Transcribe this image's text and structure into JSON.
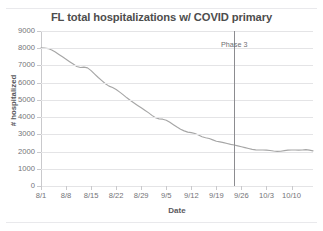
{
  "chart_data": {
    "type": "line",
    "title": "FL total hospitalizations w/ COVID primary",
    "xlabel": "Date",
    "ylabel": "# hospitalized",
    "ylim": [
      0,
      9000
    ],
    "ytick_labels": [
      "9000",
      "8000",
      "7000",
      "6000",
      "5000",
      "4000",
      "3000",
      "2000",
      "1000",
      "0"
    ],
    "ytick_values": [
      9000,
      8000,
      7000,
      6000,
      5000,
      4000,
      3000,
      2000,
      1000,
      0
    ],
    "xtick_labels": [
      "8/1",
      "8/8",
      "8/15",
      "8/22",
      "8/29",
      "9/5",
      "9/12",
      "9/19",
      "9/26",
      "10/3",
      "10/10"
    ],
    "xtick_day_index": [
      0,
      7,
      14,
      21,
      28,
      35,
      42,
      49,
      56,
      63,
      70
    ],
    "x_day_range": [
      0,
      76
    ],
    "grid": "horizontal",
    "legend": "none",
    "series": [
      {
        "name": "FL total hospitalizations w/ COVID primary",
        "color": "#a6a6a6",
        "x": [
          0,
          1,
          2,
          3,
          4,
          5,
          6,
          7,
          8,
          9,
          10,
          11,
          12,
          13,
          14,
          15,
          16,
          17,
          18,
          19,
          20,
          21,
          22,
          23,
          24,
          25,
          26,
          27,
          28,
          29,
          30,
          31,
          32,
          33,
          34,
          35,
          36,
          37,
          38,
          39,
          40,
          41,
          42,
          43,
          44,
          45,
          46,
          47,
          48,
          49,
          50,
          51,
          52,
          53,
          54,
          55,
          56,
          57,
          58,
          59,
          60,
          61,
          62,
          63,
          64,
          65,
          66,
          67,
          68,
          69,
          70,
          71,
          72,
          73,
          74,
          75,
          76
        ],
        "values": [
          8020,
          8010,
          7980,
          7900,
          7780,
          7640,
          7500,
          7360,
          7220,
          7080,
          6940,
          6880,
          6900,
          6860,
          6700,
          6500,
          6300,
          6120,
          5940,
          5800,
          5720,
          5600,
          5450,
          5290,
          5120,
          4960,
          4820,
          4680,
          4540,
          4400,
          4260,
          4100,
          3960,
          3900,
          3880,
          3820,
          3700,
          3560,
          3420,
          3300,
          3200,
          3130,
          3100,
          3050,
          2960,
          2860,
          2800,
          2760,
          2680,
          2600,
          2560,
          2520,
          2470,
          2420,
          2380,
          2330,
          2280,
          2230,
          2180,
          2130,
          2100,
          2090,
          2090,
          2080,
          2060,
          2030,
          2010,
          2020,
          2050,
          2080,
          2090,
          2090,
          2080,
          2090,
          2110,
          2080,
          2040
        ]
      }
    ],
    "annotations": [
      {
        "name": "phase-3-marker",
        "label": "Phase 3",
        "x_day_index": 54,
        "type": "vertical-line",
        "color": "#8c8c90"
      }
    ]
  }
}
